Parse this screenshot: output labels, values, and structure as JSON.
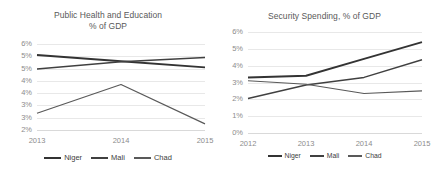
{
  "charts": [
    {
      "title_line1": "Public Health and Education",
      "title_line2": "% of GDP",
      "legend": [
        {
          "label": "Niger",
          "color": "#333333"
        },
        {
          "label": "Mali",
          "color": "#404040"
        },
        {
          "label": "Chad",
          "color": "#595959"
        }
      ]
    },
    {
      "title_line1": "Security Spending, % of GDP",
      "title_line2": "",
      "legend": [
        {
          "label": "Niger",
          "color": "#333333"
        },
        {
          "label": "Mali",
          "color": "#404040"
        },
        {
          "label": "Chad",
          "color": "#595959"
        }
      ]
    }
  ],
  "chart_data": [
    {
      "type": "line",
      "title": "Public Health and Education % of GDP",
      "xlabel": "",
      "ylabel": "",
      "x": [
        "2013",
        "2014",
        "2015"
      ],
      "categories": [
        "2013",
        "2014",
        "2015"
      ],
      "ylim": [
        2.5,
        6.0
      ],
      "ytick_values": [
        6.0,
        5.5,
        5.0,
        4.5,
        4.0,
        3.5,
        3.0,
        2.5
      ],
      "ytick_labels": [
        "6%",
        "5%",
        "5%",
        "4%",
        "4%",
        "3%",
        "3%",
        "2%"
      ],
      "grid": true,
      "legend_position": "bottom",
      "series": [
        {
          "name": "Niger",
          "color": "#333333",
          "values": [
            5.55,
            5.3,
            5.05
          ]
        },
        {
          "name": "Mali",
          "color": "#404040",
          "values": [
            4.98,
            5.28,
            5.45
          ]
        },
        {
          "name": "Chad",
          "color": "#595959",
          "values": [
            3.18,
            4.35,
            2.75
          ]
        }
      ]
    },
    {
      "type": "line",
      "title": "Security Spending, % of GDP",
      "xlabel": "",
      "ylabel": "",
      "x": [
        "2012",
        "2013",
        "2014",
        "2015"
      ],
      "categories": [
        "2012",
        "2013",
        "2014",
        "2015"
      ],
      "ylim": [
        0,
        6.0
      ],
      "ytick_values": [
        6,
        5,
        4,
        3,
        2,
        1,
        0
      ],
      "ytick_labels": [
        "6%",
        "5%",
        "4%",
        "3%",
        "2%",
        "1%",
        "0%"
      ],
      "grid": true,
      "legend_position": "bottom",
      "series": [
        {
          "name": "Niger",
          "color": "#333333",
          "values": [
            3.3,
            3.4,
            4.4,
            5.4
          ]
        },
        {
          "name": "Mali",
          "color": "#404040",
          "values": [
            2.05,
            2.85,
            3.3,
            4.35
          ]
        },
        {
          "name": "Chad",
          "color": "#595959",
          "values": [
            3.1,
            2.9,
            2.35,
            2.5
          ]
        }
      ]
    }
  ]
}
